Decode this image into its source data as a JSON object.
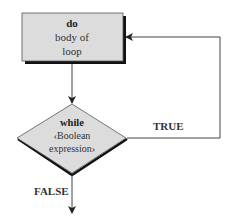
{
  "diagram": {
    "process_box": {
      "keyword": "do",
      "lines": [
        "body of",
        "loop"
      ]
    },
    "decision": {
      "keyword": "while",
      "lines": [
        "‹Boolean",
        "expression›"
      ]
    },
    "edges": {
      "true_label": "TRUE",
      "false_label": "FALSE"
    },
    "colors": {
      "fill": "#dcdcdc",
      "stroke": "#222222",
      "shadow": "#111111",
      "line": "#444444"
    }
  }
}
